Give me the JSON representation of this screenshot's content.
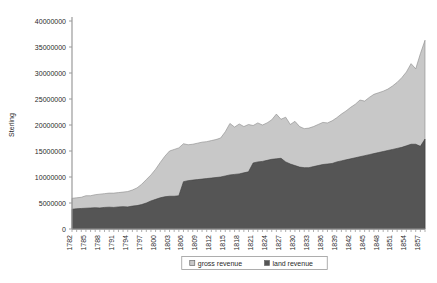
{
  "chart_data": {
    "type": "area",
    "stacked": true,
    "title": "",
    "xlabel": "",
    "ylabel": "Sterling",
    "ylim": [
      0,
      40000000
    ],
    "ytick_step": 5000000,
    "yticks": [
      0,
      5000000,
      10000000,
      15000000,
      20000000,
      25000000,
      30000000,
      35000000,
      40000000
    ],
    "ytick_labels": [
      "0",
      "5000000",
      "10000000",
      "15000000",
      "20000000",
      "25000000",
      "30000000",
      "35000000",
      "40000000"
    ],
    "grid": false,
    "legend_position": "bottom",
    "xtick_step": 3,
    "xtick_labels": [
      "1782",
      "1785",
      "1788",
      "1791",
      "1794",
      "1797",
      "1800",
      "1803",
      "1806",
      "1809",
      "1812",
      "1815",
      "1818",
      "1821",
      "1824",
      "1827",
      "1830",
      "1833",
      "1836",
      "1839",
      "1842",
      "1845",
      "1848",
      "1851",
      "1854",
      "1857"
    ],
    "x": [
      1782,
      1783,
      1784,
      1785,
      1786,
      1787,
      1788,
      1789,
      1790,
      1791,
      1792,
      1793,
      1794,
      1795,
      1796,
      1797,
      1798,
      1799,
      1800,
      1801,
      1802,
      1803,
      1804,
      1805,
      1806,
      1807,
      1808,
      1809,
      1810,
      1811,
      1812,
      1813,
      1814,
      1815,
      1816,
      1817,
      1818,
      1819,
      1820,
      1821,
      1822,
      1823,
      1824,
      1825,
      1826,
      1827,
      1828,
      1829,
      1830,
      1831,
      1832,
      1833,
      1834,
      1835,
      1836,
      1837,
      1838,
      1839,
      1840,
      1841,
      1842,
      1843,
      1844,
      1845,
      1846,
      1847,
      1848,
      1849,
      1850,
      1851,
      1852,
      1853,
      1854,
      1855,
      1856,
      1857,
      1858
    ],
    "series": [
      {
        "name": "land revenue",
        "color": "#555555",
        "values": [
          3800000,
          3900000,
          3950000,
          4000000,
          4050000,
          4100000,
          4050000,
          4150000,
          4200000,
          4150000,
          4250000,
          4300000,
          4250000,
          4400000,
          4500000,
          4700000,
          5000000,
          5400000,
          5700000,
          6000000,
          6200000,
          6300000,
          6300000,
          6400000,
          9100000,
          9300000,
          9400000,
          9500000,
          9600000,
          9700000,
          9800000,
          9900000,
          10000000,
          10200000,
          10400000,
          10500000,
          10600000,
          10800000,
          11000000,
          12700000,
          12900000,
          13000000,
          13200000,
          13400000,
          13500000,
          13600000,
          12900000,
          12500000,
          12200000,
          11900000,
          11800000,
          11800000,
          12000000,
          12200000,
          12400000,
          12500000,
          12600000,
          12900000,
          13100000,
          13300000,
          13500000,
          13700000,
          13900000,
          14100000,
          14300000,
          14500000,
          14700000,
          14900000,
          15100000,
          15300000,
          15500000,
          15700000,
          16000000,
          16300000,
          16300000,
          15900000,
          17300000
        ]
      },
      {
        "name": "gross revenue",
        "color": "#c8c8c8",
        "values": [
          5900000,
          6000000,
          6100000,
          6400000,
          6400000,
          6600000,
          6700000,
          6800000,
          6900000,
          6900000,
          7000000,
          7100000,
          7200000,
          7500000,
          7900000,
          8600000,
          9500000,
          10400000,
          11500000,
          12800000,
          14000000,
          15000000,
          15300000,
          15600000,
          16400000,
          16200000,
          16300000,
          16500000,
          16700000,
          16800000,
          17000000,
          17200000,
          17500000,
          18700000,
          20300000,
          19600000,
          20200000,
          19700000,
          20100000,
          19900000,
          20400000,
          20000000,
          20400000,
          21000000,
          22100000,
          21100000,
          21500000,
          20100000,
          20700000,
          19700000,
          19300000,
          19400000,
          19700000,
          20100000,
          20500000,
          20400000,
          20800000,
          21400000,
          22100000,
          22700000,
          23400000,
          24000000,
          24800000,
          24600000,
          25300000,
          25900000,
          26200000,
          26500000,
          26900000,
          27500000,
          28200000,
          29100000,
          30200000,
          31800000,
          30800000,
          33700000,
          36300000
        ]
      }
    ],
    "legend": [
      {
        "label": "gross revenue",
        "color": "#c8c8c8"
      },
      {
        "label": "land revenue",
        "color": "#555555"
      }
    ]
  }
}
